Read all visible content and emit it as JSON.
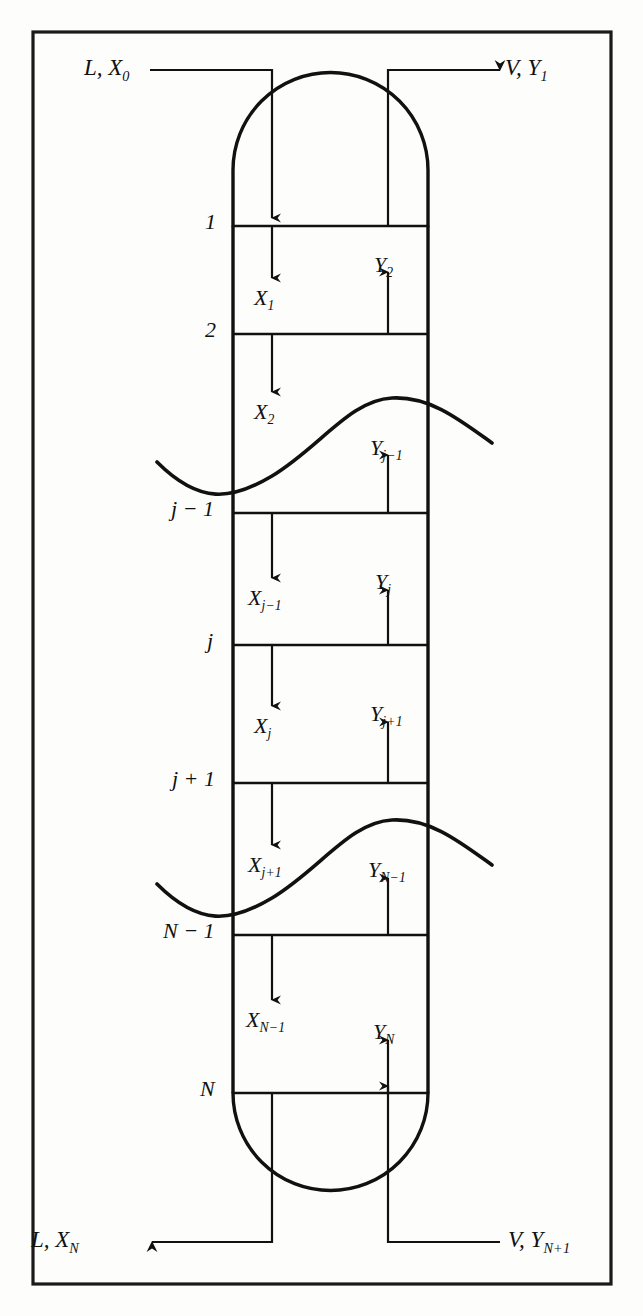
{
  "figure": {
    "kind": "process-flow-diagram",
    "frame_color": "#1a1a1a",
    "line_color": "#111111",
    "background": "#fdfdfc"
  },
  "streams": {
    "top_liquid_in": {
      "flow": "L",
      "comp": "X",
      "index": "0",
      "text": "L, X",
      "sub": "0"
    },
    "top_vapor_out": {
      "flow": "V",
      "comp": "Y",
      "index": "1",
      "text": "V, Y",
      "sub": "1"
    },
    "bottom_liquid_out": {
      "flow": "L",
      "comp": "X",
      "index": "N",
      "text": "L, X",
      "sub": "N"
    },
    "bottom_vapor_in": {
      "flow": "V",
      "comp": "Y",
      "index": "N+1",
      "text": "V, Y",
      "sub": "N+1"
    }
  },
  "stages": [
    {
      "id": "stage-1",
      "label": "1",
      "sub": ""
    },
    {
      "id": "stage-2",
      "label": "2",
      "sub": ""
    },
    {
      "id": "stage-jm1",
      "label": "j − 1",
      "sub": ""
    },
    {
      "id": "stage-j",
      "label": "j",
      "sub": ""
    },
    {
      "id": "stage-jp1",
      "label": "j + 1",
      "sub": ""
    },
    {
      "id": "stage-Nm1",
      "label": "N − 1",
      "sub": ""
    },
    {
      "id": "stage-N",
      "label": "N",
      "sub": ""
    }
  ],
  "liquid_flows": [
    {
      "id": "x-1",
      "base": "X",
      "sub": "1"
    },
    {
      "id": "x-2",
      "base": "X",
      "sub": "2"
    },
    {
      "id": "x-jm1",
      "base": "X",
      "sub": "j−1"
    },
    {
      "id": "x-j",
      "base": "X",
      "sub": "j"
    },
    {
      "id": "x-jp1",
      "base": "X",
      "sub": "j+1"
    },
    {
      "id": "x-Nm1",
      "base": "X",
      "sub": "N−1"
    }
  ],
  "vapor_flows": [
    {
      "id": "y-2",
      "base": "Y",
      "sub": "2"
    },
    {
      "id": "y-jm1",
      "base": "Y",
      "sub": "j−1"
    },
    {
      "id": "y-j",
      "base": "Y",
      "sub": "j"
    },
    {
      "id": "y-jp1",
      "base": "Y",
      "sub": "j+1"
    },
    {
      "id": "y-Nm1",
      "base": "Y",
      "sub": "N−1"
    },
    {
      "id": "y-N",
      "base": "Y",
      "sub": "N"
    }
  ]
}
